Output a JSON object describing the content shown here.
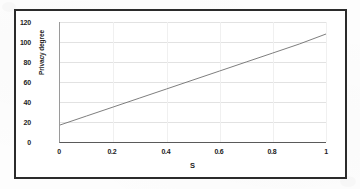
{
  "figure": {
    "frame_color": "#2b2b2b",
    "background_color": "#ffffff"
  },
  "chart_data": {
    "type": "line",
    "title": "",
    "xlabel": "S",
    "ylabel": "Privacy degree",
    "xlim": [
      0,
      1
    ],
    "ylim": [
      0,
      120
    ],
    "xticks": [
      "0",
      "0.2",
      "0.4",
      "0.6",
      "0.8",
      "1"
    ],
    "xtick_values": [
      0,
      0.2,
      0.4,
      0.6,
      0.8,
      1
    ],
    "yticks": [
      "0",
      "20",
      "40",
      "60",
      "80",
      "100",
      "120"
    ],
    "ytick_values": [
      0,
      20,
      40,
      60,
      80,
      100,
      120
    ],
    "grid": true,
    "grid_axis": "both",
    "legend": false,
    "legend_position": "none",
    "line_color": "#6f6f6f",
    "series": [
      {
        "name": "Privacy degree",
        "x": [
          0,
          0.1,
          0.2,
          0.3,
          0.4,
          0.5,
          0.6,
          0.7,
          0.8,
          0.9,
          1
        ],
        "values": [
          17,
          26,
          35,
          44,
          53,
          62,
          71,
          80,
          89,
          98,
          108
        ]
      }
    ]
  }
}
